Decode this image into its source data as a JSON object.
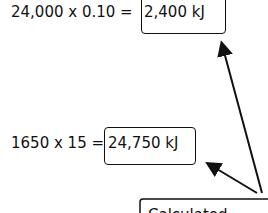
{
  "equations": [
    {
      "expression": "24,000 x 0.10 =",
      "result": "2,400 kJ"
    },
    {
      "expression": "1650 x 15 =",
      "result": "24,750 kJ"
    }
  ],
  "callout": {
    "label": "Calculated"
  }
}
